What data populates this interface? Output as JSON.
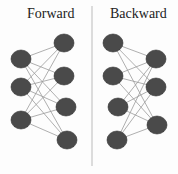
{
  "panels": {
    "forward": {
      "title": "Forward"
    },
    "backward": {
      "title": "Backward"
    }
  },
  "colors": {
    "node": "#4a4a4a",
    "edge": "#9a9a9a",
    "divider": "#bbbbbb"
  }
}
